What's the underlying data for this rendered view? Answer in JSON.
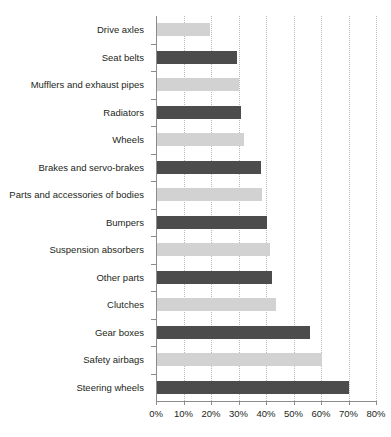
{
  "chart_data": {
    "type": "bar",
    "orientation": "horizontal",
    "title": "",
    "xlabel": "",
    "ylabel": "",
    "xlim": [
      0,
      80
    ],
    "xticks": [
      0,
      10,
      20,
      30,
      40,
      50,
      60,
      70,
      80
    ],
    "xtick_labels": [
      "0%",
      "10%",
      "20%",
      "30%",
      "40%",
      "50%",
      "60%",
      "70%",
      "80%"
    ],
    "grid": true,
    "grid_axis": "x",
    "legend": "none",
    "categories": [
      "Drive axles",
      "Seat belts",
      "Mufflers and exhaust pipes",
      "Radiators",
      "Wheels",
      "Brakes and servo-brakes",
      "Parts and accessories of bodies",
      "Bumpers",
      "Suspension absorbers",
      "Other parts",
      "Clutches",
      "Gear boxes",
      "Safety airbags",
      "Steering wheels"
    ],
    "values": [
      19.5,
      29.5,
      30,
      31,
      32,
      38,
      38.5,
      40.5,
      41.5,
      42,
      43.5,
      56,
      60.5,
      70
    ],
    "bar_colors": [
      "light",
      "dark",
      "light",
      "dark",
      "light",
      "dark",
      "light",
      "dark",
      "light",
      "dark",
      "light",
      "dark",
      "light",
      "dark"
    ]
  },
  "colors": {
    "bar_dark": "#4c4c4c",
    "bar_light": "#d2d2d2",
    "axis": "#8c8c8c",
    "gridline": "#b9b9b9",
    "text": "#231f20",
    "background": "#ffffff"
  }
}
